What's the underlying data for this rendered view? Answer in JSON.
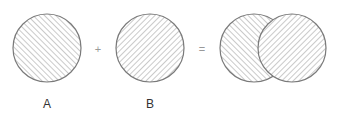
{
  "diagram": {
    "type": "set-union",
    "colors": {
      "outline": "#7a7a7a",
      "hatch": "#b4b4b4",
      "background": "#ffffff"
    },
    "operands": [
      {
        "id": "A",
        "label": "A",
        "hatch": "forward-diagonal",
        "cx": 47,
        "cy": 48,
        "r": 34
      },
      {
        "id": "B",
        "label": "B",
        "hatch": "backward-diagonal",
        "cx": 150,
        "cy": 48,
        "r": 34
      }
    ],
    "operators": {
      "plus": "+",
      "equals": "="
    },
    "result": {
      "circles": [
        {
          "of": "A",
          "cx": 254,
          "cy": 48,
          "r": 34,
          "hatch": "forward-diagonal"
        },
        {
          "of": "B",
          "cx": 292,
          "cy": 48,
          "r": 34,
          "hatch": "backward-diagonal"
        }
      ]
    }
  }
}
